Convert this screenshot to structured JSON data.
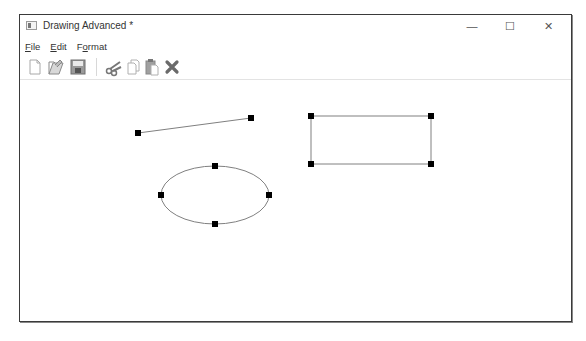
{
  "window": {
    "title": "Drawing Advanced *",
    "controls": {
      "minimize": "—",
      "maximize": "☐",
      "close": "✕"
    }
  },
  "menubar": {
    "items": [
      {
        "label": "File",
        "mnemonic": "F"
      },
      {
        "label": "Edit",
        "mnemonic": "E"
      },
      {
        "label": "Format",
        "mnemonic": "o"
      }
    ]
  },
  "toolbar": {
    "buttons": [
      {
        "name": "new",
        "icon": "new-document-icon"
      },
      {
        "name": "open",
        "icon": "open-folder-icon"
      },
      {
        "name": "save",
        "icon": "save-floppy-icon"
      },
      {
        "name": "cut",
        "icon": "scissors-icon"
      },
      {
        "name": "copy",
        "icon": "copy-icon"
      },
      {
        "name": "paste",
        "icon": "paste-icon"
      },
      {
        "name": "delete",
        "icon": "delete-x-icon"
      }
    ]
  },
  "canvas": {
    "shapes": [
      {
        "type": "line",
        "x1": 137,
        "y1": 132,
        "x2": 250,
        "y2": 117,
        "selected": true
      },
      {
        "type": "rectangle",
        "x": 310,
        "y": 115,
        "width": 120,
        "height": 48,
        "selected": true
      },
      {
        "type": "ellipse",
        "cx": 214,
        "cy": 194,
        "rx": 54,
        "ry": 29,
        "selected": true
      }
    ],
    "stroke_color": "#808080",
    "handle_color": "#000000"
  }
}
